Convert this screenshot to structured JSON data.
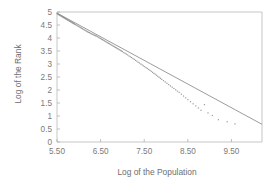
{
  "chart_data": {
    "type": "scatter",
    "title": "",
    "xlabel": "Log of the Population",
    "ylabel": "Log of the Rank",
    "xlim": [
      5.5,
      10.2
    ],
    "ylim": [
      0,
      5
    ],
    "xticks": [
      5.5,
      6.5,
      7.5,
      8.5,
      9.5
    ],
    "xtick_labels": [
      "5.50",
      "6.50",
      "7.50",
      "8.50",
      "9.50"
    ],
    "yticks": [
      0,
      0.5,
      1,
      1.5,
      2,
      2.5,
      3,
      3.5,
      4,
      4.5,
      5
    ],
    "ytick_labels": [
      "0",
      "0.5",
      "1",
      "1.5",
      "2",
      "2.5",
      "3",
      "3.5",
      "4",
      "4.5",
      "5"
    ],
    "grid": false,
    "legend": false,
    "frame": "box",
    "series": [
      {
        "name": "Rank-size data",
        "marker": "dot",
        "color": "#9a9a9a",
        "x": [
          5.5,
          5.51,
          5.52,
          5.53,
          5.54,
          5.55,
          5.56,
          5.57,
          5.58,
          5.59,
          5.6,
          5.61,
          5.62,
          5.63,
          5.64,
          5.65,
          5.66,
          5.67,
          5.68,
          5.69,
          5.7,
          5.71,
          5.72,
          5.73,
          5.74,
          5.75,
          5.76,
          5.77,
          5.78,
          5.79,
          5.8,
          5.81,
          5.82,
          5.83,
          5.84,
          5.85,
          5.86,
          5.87,
          5.88,
          5.89,
          5.9,
          5.92,
          5.94,
          5.96,
          5.98,
          6.0,
          6.02,
          6.04,
          6.06,
          6.08,
          6.1,
          6.12,
          6.14,
          6.16,
          6.18,
          6.2,
          6.22,
          6.24,
          6.26,
          6.28,
          6.3,
          6.32,
          6.34,
          6.36,
          6.38,
          6.4,
          6.42,
          6.44,
          6.46,
          6.48,
          6.5,
          6.52,
          6.54,
          6.56,
          6.58,
          6.6,
          6.62,
          6.64,
          6.66,
          6.68,
          6.7,
          6.72,
          6.74,
          6.76,
          6.78,
          6.8,
          6.82,
          6.84,
          6.86,
          6.88,
          6.9,
          6.92,
          6.94,
          6.96,
          6.98,
          7.0,
          7.03,
          7.06,
          7.09,
          7.12,
          7.15,
          7.18,
          7.21,
          7.24,
          7.27,
          7.3,
          7.33,
          7.36,
          7.39,
          7.42,
          7.45,
          7.48,
          7.51,
          7.54,
          7.57,
          7.6,
          7.63,
          7.66,
          7.69,
          7.72,
          7.75,
          7.78,
          7.81,
          7.84,
          7.87,
          7.9,
          7.94,
          7.98,
          8.02,
          8.06,
          8.1,
          8.14,
          8.18,
          8.22,
          8.26,
          8.3,
          8.35,
          8.4,
          8.45,
          8.5,
          8.56,
          8.62,
          8.68,
          8.74,
          8.8,
          8.88,
          8.96,
          9.06,
          9.2,
          9.4,
          9.58
        ],
        "y": [
          4.95,
          4.93,
          4.92,
          4.91,
          4.9,
          4.89,
          4.88,
          4.87,
          4.86,
          4.85,
          4.84,
          4.83,
          4.82,
          4.81,
          4.8,
          4.79,
          4.78,
          4.77,
          4.76,
          4.75,
          4.74,
          4.73,
          4.72,
          4.71,
          4.7,
          4.69,
          4.68,
          4.67,
          4.66,
          4.65,
          4.64,
          4.63,
          4.62,
          4.61,
          4.6,
          4.59,
          4.58,
          4.57,
          4.56,
          4.55,
          4.54,
          4.52,
          4.5,
          4.48,
          4.46,
          4.44,
          4.42,
          4.4,
          4.38,
          4.36,
          4.34,
          4.32,
          4.3,
          4.28,
          4.26,
          4.24,
          4.22,
          4.21,
          4.19,
          4.17,
          4.15,
          4.14,
          4.12,
          4.11,
          4.09,
          4.08,
          4.06,
          4.04,
          4.02,
          4.0,
          3.98,
          3.96,
          3.94,
          3.92,
          3.9,
          3.88,
          3.86,
          3.84,
          3.82,
          3.8,
          3.78,
          3.76,
          3.74,
          3.72,
          3.7,
          3.68,
          3.66,
          3.64,
          3.62,
          3.6,
          3.58,
          3.56,
          3.54,
          3.52,
          3.5,
          3.48,
          3.44,
          3.41,
          3.38,
          3.35,
          3.31,
          3.28,
          3.25,
          3.21,
          3.18,
          3.14,
          3.11,
          3.07,
          3.04,
          3.0,
          2.97,
          2.93,
          2.9,
          2.86,
          2.83,
          2.79,
          2.76,
          2.72,
          2.68,
          2.64,
          2.61,
          2.57,
          2.53,
          2.49,
          2.45,
          2.41,
          2.36,
          2.31,
          2.26,
          2.21,
          2.16,
          2.11,
          2.06,
          2.01,
          1.96,
          1.91,
          1.84,
          1.77,
          1.7,
          1.63,
          1.55,
          1.47,
          1.39,
          1.31,
          1.22,
          1.44,
          1.12,
          1.02,
          0.86,
          0.78,
          0.7
        ]
      }
    ],
    "fit_line": {
      "name": "Least-squares fit",
      "color": "#8a8a8a",
      "x": [
        5.5,
        10.2
      ],
      "y": [
        4.96,
        0.68
      ]
    }
  },
  "axis": {
    "x_title": "Log of the Population",
    "y_title": "Log of the Rank"
  }
}
